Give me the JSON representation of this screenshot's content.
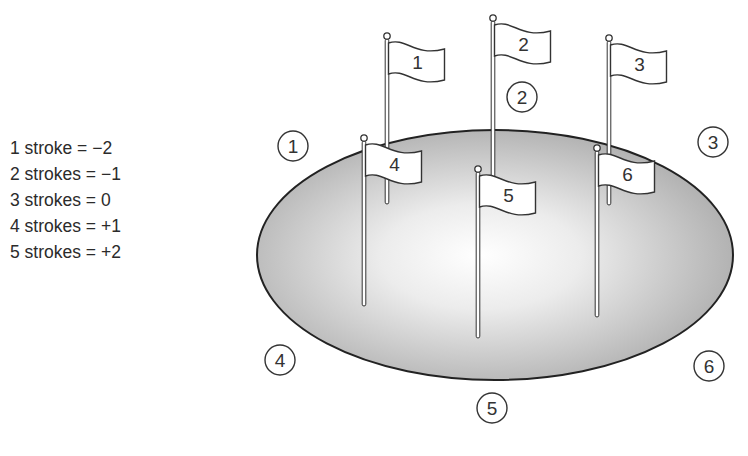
{
  "legend": {
    "items": [
      {
        "label": "1 stroke = −2"
      },
      {
        "label": "2 strokes = −1"
      },
      {
        "label": "3 strokes = 0"
      },
      {
        "label": "4 strokes = +1"
      },
      {
        "label": "5 strokes = +2"
      }
    ]
  },
  "green": {
    "shape": "ellipse",
    "cx": 495,
    "cy": 255,
    "rx": 238,
    "ry": 125,
    "fill_dark": "#a9a9a9",
    "fill_light": "#ffffff",
    "stroke": "#222222"
  },
  "flags": [
    {
      "label": "1",
      "pole_x": 387,
      "ball_y": 36,
      "pole_bottom": 204,
      "flag_y": 43
    },
    {
      "label": "2",
      "pole_x": 493,
      "ball_y": 18,
      "pole_bottom": 178,
      "flag_y": 25
    },
    {
      "label": "3",
      "pole_x": 609,
      "ball_y": 38,
      "pole_bottom": 205,
      "flag_y": 45
    },
    {
      "label": "4",
      "pole_x": 364,
      "ball_y": 138,
      "pole_bottom": 306,
      "flag_y": 145
    },
    {
      "label": "5",
      "pole_x": 478,
      "ball_y": 169,
      "pole_bottom": 338,
      "flag_y": 176
    },
    {
      "label": "6",
      "pole_x": 597,
      "ball_y": 148,
      "pole_bottom": 317,
      "flag_y": 155
    }
  ],
  "markers": [
    {
      "label": "1",
      "cx": 293,
      "cy": 146
    },
    {
      "label": "2",
      "cx": 522,
      "cy": 97
    },
    {
      "label": "3",
      "cx": 713,
      "cy": 142
    },
    {
      "label": "4",
      "cx": 280,
      "cy": 360
    },
    {
      "label": "5",
      "cx": 492,
      "cy": 408
    },
    {
      "label": "6",
      "cx": 709,
      "cy": 366
    }
  ]
}
